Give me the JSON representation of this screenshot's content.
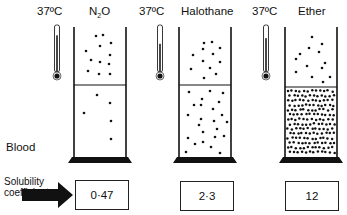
{
  "temperature_label": "37ºC",
  "blood_label": "Blood",
  "solubility_label_line1": "Solubility",
  "solubility_label_line2": "coefficient",
  "columns": [
    {
      "gas": "N",
      "gas_subscript": "2",
      "gas_suffix": "O",
      "solubility_coefficient": "0·47",
      "cylinder": {
        "x": 74,
        "w": 52,
        "top": 27,
        "divider": 85,
        "bottom": 157
      },
      "thermometer_x": 57,
      "thermometer_fill": 0.78,
      "gas_dots": [
        [
          96,
          36
        ],
        [
          103,
          35
        ],
        [
          111,
          43
        ],
        [
          100,
          46
        ],
        [
          110,
          55
        ],
        [
          86,
          51
        ],
        [
          91,
          60
        ],
        [
          100,
          62
        ],
        [
          109,
          64
        ],
        [
          88,
          71
        ],
        [
          99,
          74
        ],
        [
          110,
          74
        ]
      ],
      "blood_dots": [
        [
          97,
          95
        ],
        [
          110,
          103
        ],
        [
          84,
          113
        ],
        [
          111,
          121
        ],
        [
          111,
          139
        ]
      ]
    },
    {
      "gas": "Halothane",
      "gas_subscript": "",
      "gas_suffix": "",
      "solubility_coefficient": "2·3",
      "cylinder": {
        "x": 179,
        "w": 52,
        "top": 27,
        "divider": 85,
        "bottom": 157
      },
      "thermometer_x": 160,
      "thermometer_fill": 0.6,
      "gas_dots": [
        [
          204,
          43
        ],
        [
          212,
          42
        ],
        [
          203,
          49
        ],
        [
          220,
          48
        ],
        [
          193,
          55
        ],
        [
          213,
          54
        ],
        [
          203,
          61
        ],
        [
          220,
          62
        ],
        [
          191,
          69
        ],
        [
          210,
          68
        ],
        [
          216,
          74
        ],
        [
          204,
          78
        ]
      ],
      "blood_dots": [
        [
          189,
          92
        ],
        [
          210,
          91
        ],
        [
          223,
          93
        ],
        [
          202,
          99
        ],
        [
          194,
          105
        ],
        [
          201,
          105
        ],
        [
          219,
          102
        ],
        [
          213,
          109
        ],
        [
          188,
          115
        ],
        [
          222,
          115
        ],
        [
          201,
          119
        ],
        [
          214,
          121
        ],
        [
          227,
          122
        ],
        [
          199,
          125
        ],
        [
          217,
          129
        ],
        [
          203,
          132
        ],
        [
          188,
          138
        ],
        [
          215,
          137
        ],
        [
          224,
          136
        ],
        [
          195,
          144
        ],
        [
          203,
          142
        ],
        [
          211,
          147
        ],
        [
          186,
          152
        ],
        [
          220,
          153
        ]
      ]
    },
    {
      "gas": "Ether",
      "gas_subscript": "",
      "gas_suffix": "",
      "solubility_coefficient": "12",
      "cylinder": {
        "x": 285,
        "w": 52,
        "top": 27,
        "divider": 87,
        "bottom": 157
      },
      "thermometer_x": 266,
      "thermometer_fill": 0.72,
      "gas_dots": [
        [
          312,
          37
        ],
        [
          322,
          44
        ],
        [
          309,
          48
        ],
        [
          319,
          52
        ],
        [
          300,
          54
        ],
        [
          296,
          59
        ],
        [
          325,
          63
        ],
        [
          307,
          66
        ],
        [
          322,
          68
        ],
        [
          296,
          72
        ],
        [
          312,
          77
        ],
        [
          330,
          77
        ],
        [
          323,
          82
        ]
      ],
      "blood_density": 150
    }
  ]
}
